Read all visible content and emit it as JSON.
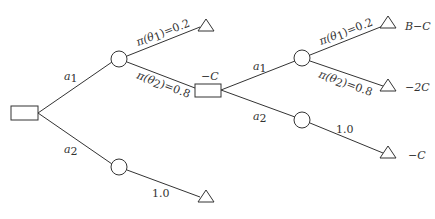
{
  "diagram": {
    "type": "decision-tree",
    "nodes": {
      "root_decision": {
        "shape": "rectangle",
        "label": ""
      },
      "chance_a1": {
        "shape": "circle"
      },
      "chance_a2": {
        "shape": "circle"
      },
      "decision_2": {
        "shape": "rectangle",
        "label": "−C"
      },
      "chance_a1_2": {
        "shape": "circle"
      },
      "chance_a2_2": {
        "shape": "circle"
      },
      "terminal_1": {
        "shape": "triangle",
        "payoff": ""
      },
      "terminal_2": {
        "shape": "triangle",
        "payoff": ""
      },
      "terminal_3": {
        "shape": "triangle",
        "payoff": "B−C"
      },
      "terminal_4": {
        "shape": "triangle",
        "payoff": "−2C"
      },
      "terminal_5": {
        "shape": "triangle",
        "payoff": "−C"
      }
    },
    "edges": {
      "root_a1": {
        "label_main": "a",
        "label_sub": "1"
      },
      "root_a2": {
        "label_main": "a",
        "label_sub": "2"
      },
      "c1_theta1": {
        "label_pre": "π(θ",
        "label_sub": "1",
        "label_post": ")=0.2"
      },
      "c1_theta2": {
        "label_pre": "π(θ",
        "label_sub": "2",
        "label_post": ")=0.8"
      },
      "c2_prob": {
        "label": "1.0"
      },
      "d2_a1": {
        "label_main": "a",
        "label_sub": "1"
      },
      "d2_a2": {
        "label_main": "a",
        "label_sub": "2"
      },
      "c3_theta1": {
        "label_pre": "π(θ",
        "label_sub": "1",
        "label_post": ")=0.2"
      },
      "c3_theta2": {
        "label_pre": "π(θ",
        "label_sub": "2",
        "label_post": ")=0.8"
      },
      "c4_prob": {
        "label": "1.0"
      }
    },
    "colors": {
      "line": "#333333",
      "text": "#333333",
      "background": "#ffffff"
    }
  }
}
